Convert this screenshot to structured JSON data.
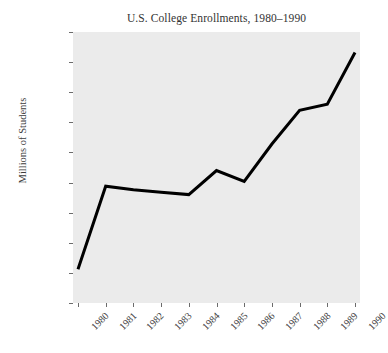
{
  "chart_data": {
    "type": "line",
    "title": "U.S. College Enrollments, 1980–1990",
    "xlabel": "",
    "ylabel": "Millions of Students",
    "x": [
      1980,
      1981,
      1982,
      1983,
      1984,
      1985,
      1986,
      1987,
      1988,
      1989,
      1990
    ],
    "categories": [
      "1980",
      "1981",
      "1982",
      "1983",
      "1984",
      "1985",
      "1986",
      "1987",
      "1988",
      "1989",
      "1990"
    ],
    "values": [
      9.28,
      9.97,
      9.94,
      9.92,
      9.9,
      10.1,
      10.01,
      10.32,
      10.6,
      10.65,
      11.08
    ],
    "series": [
      {
        "name": "Enrollment",
        "values": [
          9.28,
          9.97,
          9.94,
          9.92,
          9.9,
          10.1,
          10.01,
          10.32,
          10.6,
          10.65,
          11.08
        ],
        "color": "#000000"
      }
    ],
    "xlim": [
      1979.82,
      1990.18
    ],
    "ylim": [
      9.0,
      11.25
    ],
    "yticks": [
      9,
      9.25,
      9.5,
      9.75,
      10,
      10.25,
      10.5,
      10.75,
      11,
      11.25
    ],
    "ytick_labels": [
      "9",
      "9.25",
      "9.5",
      "9.75",
      "10",
      "10.25",
      "10.5",
      "10.75",
      "11",
      "11.25"
    ],
    "xticks": [
      1980,
      1981,
      1982,
      1983,
      1984,
      1985,
      1986,
      1987,
      1988,
      1989,
      1990
    ],
    "xtick_labels": [
      "1980",
      "1981",
      "1982",
      "1983",
      "1984",
      "1985",
      "1986",
      "1987",
      "1988",
      "1989",
      "1990"
    ],
    "grid": false,
    "legend": false,
    "legend_position": "none",
    "line_width": 3,
    "plot_background": "#ebebeb",
    "figure_background": "#ffffff",
    "text_color": "#3b3b3b"
  }
}
